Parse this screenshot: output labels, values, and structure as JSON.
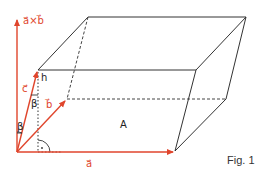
{
  "figure": {
    "caption": "Fig. 1",
    "colors": {
      "vector": "#e0452c",
      "edge": "#333333"
    },
    "labels": {
      "cross_product": "a⃗×b⃗",
      "vec_a": "a⃗",
      "vec_b": "b⃗",
      "vec_c": "c⃗",
      "height": "h",
      "angle_beta_1": "β",
      "angle_beta_2": "β",
      "base_area": "A",
      "right_angle": "·"
    }
  }
}
